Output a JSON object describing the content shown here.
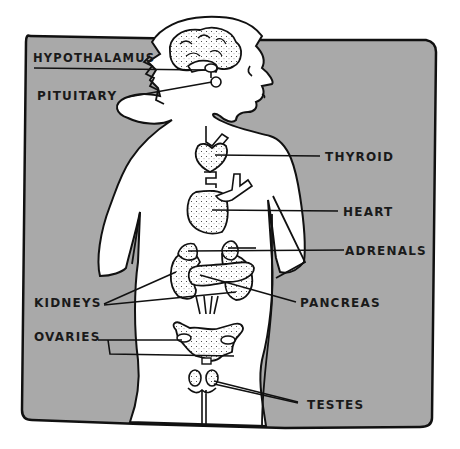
{
  "diagram": {
    "colors": {
      "background_panel": "#a9a9a9",
      "body_fill": "#ffffff",
      "outline": "#111111",
      "page": "#ffffff"
    },
    "labels": [
      {
        "id": "hypothalamus",
        "text": "HYPOTHALAMUS",
        "side": "left"
      },
      {
        "id": "pituitary",
        "text": "PITUITARY",
        "side": "left"
      },
      {
        "id": "thyroid",
        "text": "THYROID",
        "side": "right"
      },
      {
        "id": "heart",
        "text": "HEART",
        "side": "right"
      },
      {
        "id": "adrenals",
        "text": "ADRENALS",
        "side": "right"
      },
      {
        "id": "kidneys",
        "text": "KIDNEYS",
        "side": "left"
      },
      {
        "id": "pancreas",
        "text": "PANCREAS",
        "side": "right"
      },
      {
        "id": "ovaries",
        "text": "OVARIES",
        "side": "left"
      },
      {
        "id": "testes",
        "text": "TESTES",
        "side": "right"
      }
    ]
  }
}
